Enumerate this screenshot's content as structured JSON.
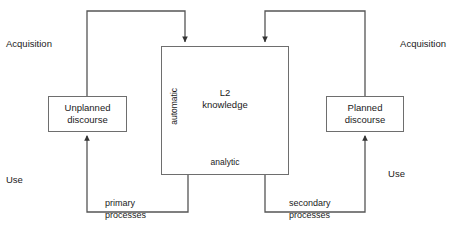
{
  "diagram": {
    "stroke_color": "#6e6e6e",
    "arrow_color": "#333333",
    "text_color": "#1a1a1a",
    "background": "#ffffff"
  },
  "nodes": {
    "unplanned": {
      "line1": "Unplanned",
      "line2": "discourse"
    },
    "planned": {
      "line1": "Planned",
      "line2": "discourse"
    },
    "central": {
      "line1": "L2",
      "line2": "knowledge",
      "axis_top_label": "automatic",
      "axis_bottom_label": "analytic"
    }
  },
  "side_labels": {
    "acquisition_left": "Acquisition",
    "acquisition_right": "Acquisition",
    "use_left": "Use",
    "use_right": "Use"
  },
  "edge_labels": {
    "primary": {
      "line1": "primary",
      "line2": "processes"
    },
    "secondary": {
      "line1": "secondary",
      "line2": "processes"
    }
  },
  "connections": [
    {
      "name": "unplanned-to-l2-acquisition",
      "from": "Unplanned discourse",
      "to": "L2 knowledge",
      "direction": "up-over-down",
      "label": "Acquisition"
    },
    {
      "name": "planned-to-l2-acquisition",
      "from": "Planned discourse",
      "to": "L2 knowledge",
      "direction": "up-over-down",
      "label": "Acquisition"
    },
    {
      "name": "l2-to-unplanned-use",
      "from": "L2 knowledge",
      "to": "Unplanned discourse",
      "direction": "down-under-up",
      "label": "primary processes"
    },
    {
      "name": "l2-to-planned-use",
      "from": "L2 knowledge",
      "to": "Planned discourse",
      "direction": "down-under-up",
      "label": "secondary processes"
    }
  ]
}
